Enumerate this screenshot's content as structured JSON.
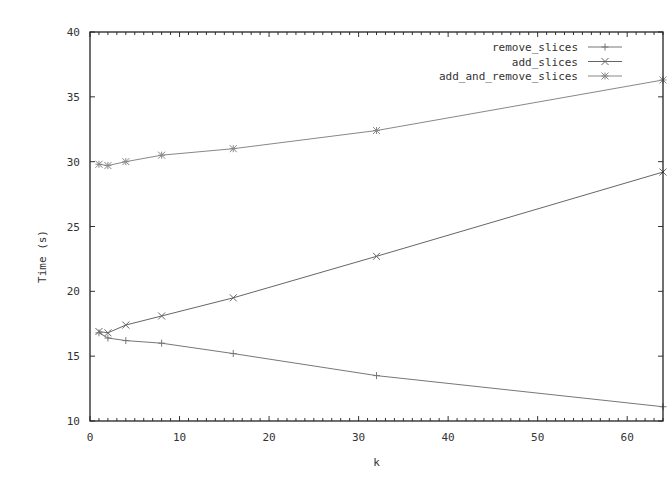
{
  "chart_data": {
    "type": "line",
    "title": "",
    "xlabel": "k",
    "ylabel": "Time (s)",
    "xlim": [
      0,
      64
    ],
    "ylim": [
      10,
      40
    ],
    "xticks": [
      0,
      10,
      20,
      30,
      40,
      50,
      60
    ],
    "yticks": [
      10,
      15,
      20,
      25,
      30,
      35,
      40
    ],
    "grid": false,
    "legend_position": "top-right",
    "x": [
      1,
      2,
      4,
      8,
      16,
      32,
      64
    ],
    "series": [
      {
        "name": "remove_slices",
        "marker": "+",
        "color": "#777777",
        "values": [
          16.8,
          16.4,
          16.2,
          16.0,
          15.2,
          13.5,
          11.1
        ]
      },
      {
        "name": "add_slices",
        "marker": "x",
        "color": "#666666",
        "values": [
          16.9,
          16.8,
          17.4,
          18.1,
          19.5,
          22.7,
          29.2
        ]
      },
      {
        "name": "add_and_remove_slices",
        "marker": "*",
        "color": "#888888",
        "values": [
          29.8,
          29.7,
          30.0,
          30.5,
          31.0,
          32.4,
          36.3
        ]
      }
    ]
  },
  "plot": {
    "left": 90,
    "right": 663,
    "top": 32,
    "bottom": 421,
    "axis_color": "#222222"
  }
}
